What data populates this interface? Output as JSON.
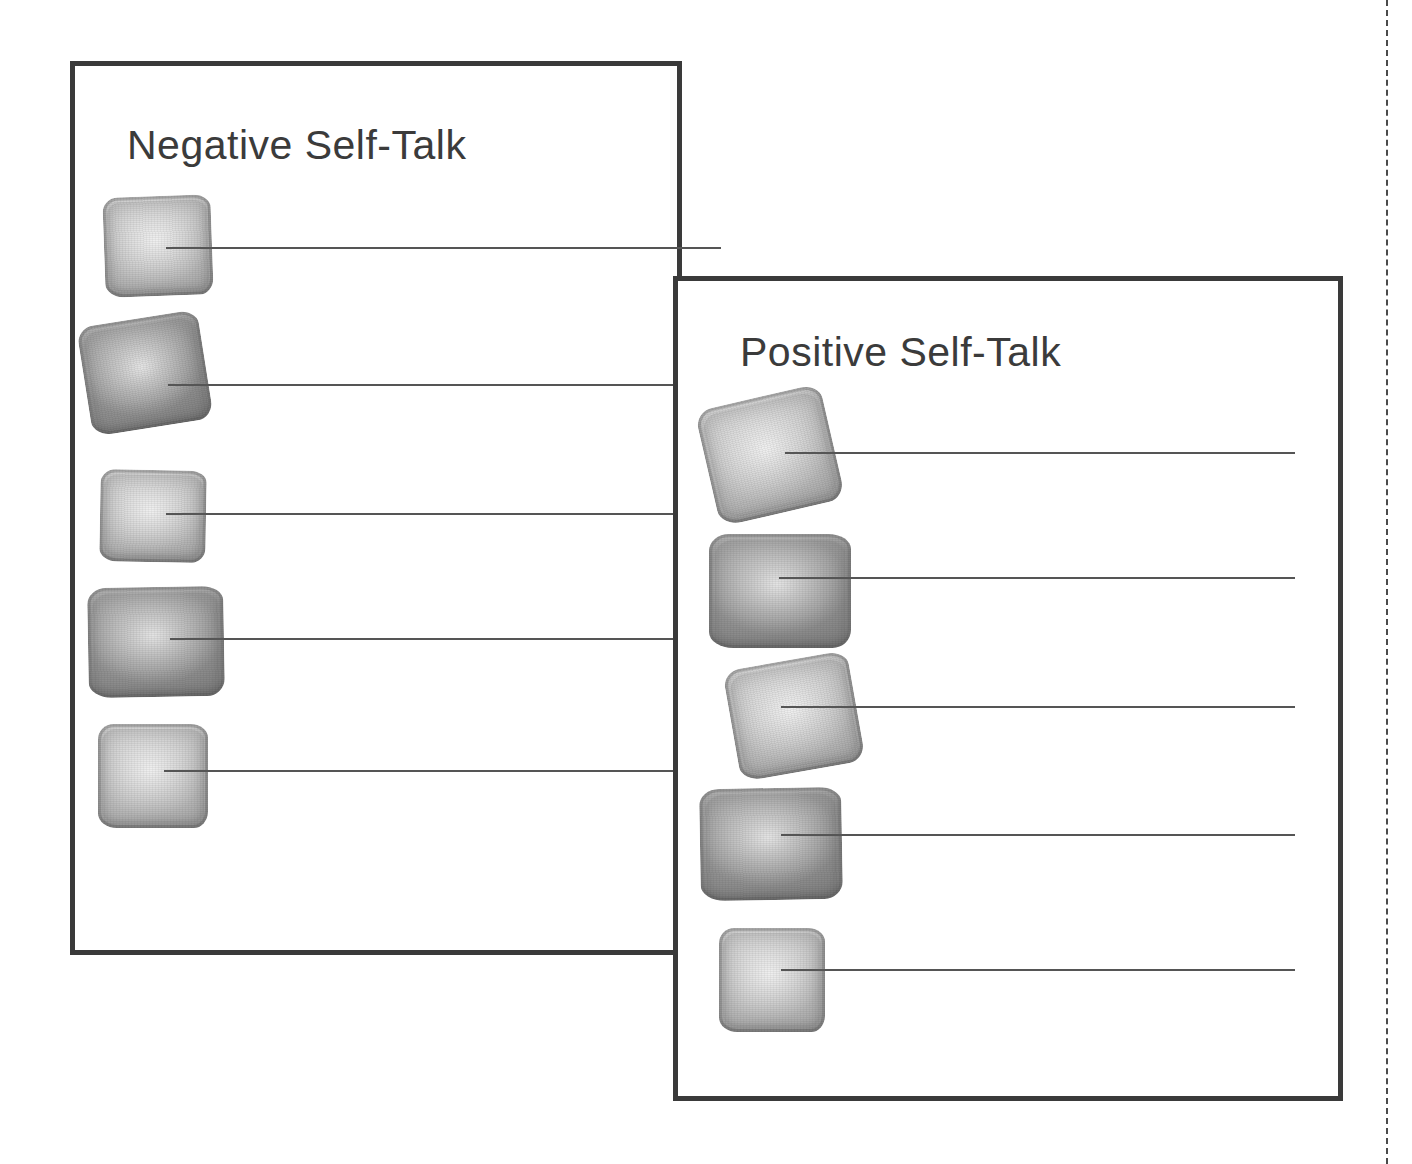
{
  "page": {
    "background_color": "#ffffff",
    "ink_color": "#3a3a3a",
    "line_color": "#555555"
  },
  "cut_guide": {
    "name": "vertical-dashed-cut-line",
    "style": "dashed",
    "color": "#4a4a4a",
    "orientation": "vertical"
  },
  "panels": [
    {
      "id": "negative",
      "title": "Negative Self-Talk",
      "border_color": "#3a3a3a",
      "rows": [
        {
          "stone": {
            "tone": "light",
            "rotation": -2,
            "left": 104,
            "top": 196,
            "width": 108,
            "height": 100
          },
          "line": {
            "left": 166,
            "top": 247,
            "width": 555
          }
        },
        {
          "stone": {
            "tone": "dark",
            "rotation": -9,
            "left": 84,
            "top": 318,
            "width": 122,
            "height": 110
          },
          "line": {
            "left": 168,
            "top": 384,
            "width": 505
          }
        },
        {
          "stone": {
            "tone": "light",
            "rotation": 1,
            "left": 100,
            "top": 470,
            "width": 106,
            "height": 92
          },
          "line": {
            "left": 166,
            "top": 513,
            "width": 507
          }
        },
        {
          "stone": {
            "tone": "dark",
            "rotation": -1,
            "left": 88,
            "top": 587,
            "width": 136,
            "height": 110
          },
          "line": {
            "left": 170,
            "top": 638,
            "width": 503
          }
        },
        {
          "stone": {
            "tone": "light",
            "rotation": 0,
            "left": 98,
            "top": 724,
            "width": 110,
            "height": 104
          },
          "line": {
            "left": 164,
            "top": 770,
            "width": 509
          }
        }
      ]
    },
    {
      "id": "positive",
      "title": "Positive Self-Talk",
      "border_color": "#3a3a3a",
      "rows": [
        {
          "stone": {
            "tone": "light",
            "rotation": -13,
            "left": 706,
            "top": 396,
            "width": 128,
            "height": 118
          },
          "line": {
            "left": 785,
            "top": 452,
            "width": 510
          }
        },
        {
          "stone": {
            "tone": "dark",
            "rotation": 0,
            "left": 709,
            "top": 534,
            "width": 142,
            "height": 114
          },
          "line": {
            "left": 779,
            "top": 577,
            "width": 516
          }
        },
        {
          "stone": {
            "tone": "light",
            "rotation": -10,
            "left": 731,
            "top": 660,
            "width": 126,
            "height": 112
          },
          "line": {
            "left": 781,
            "top": 706,
            "width": 514
          }
        },
        {
          "stone": {
            "tone": "dark",
            "rotation": -1,
            "left": 700,
            "top": 788,
            "width": 142,
            "height": 112
          },
          "line": {
            "left": 781,
            "top": 834,
            "width": 514
          }
        },
        {
          "stone": {
            "tone": "light",
            "rotation": 0,
            "left": 719,
            "top": 928,
            "width": 106,
            "height": 104
          },
          "line": {
            "left": 781,
            "top": 969,
            "width": 514
          }
        }
      ]
    }
  ]
}
